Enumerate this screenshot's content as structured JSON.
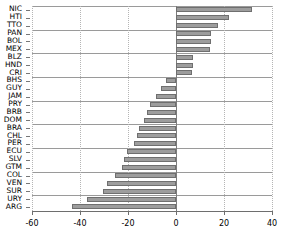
{
  "chart_data": {
    "type": "bar",
    "orientation": "horizontal",
    "title": "",
    "xlabel": "",
    "ylabel": "",
    "xlim": [
      -60,
      40
    ],
    "ylim": null,
    "grid": true,
    "legend": null,
    "xticks": [
      -60,
      -40,
      -20,
      0,
      20,
      40
    ],
    "xtick_labels": [
      "-60",
      "-40",
      "-20",
      "0",
      "20",
      "40"
    ],
    "categories": [
      "NIC",
      "HTI",
      "TTO",
      "PAN",
      "BOL",
      "MEX",
      "BLZ",
      "HND",
      "CRI",
      "BHS",
      "GUY",
      "JAM",
      "PRY",
      "BRB",
      "DOM",
      "BRA",
      "CHL",
      "PER",
      "ECU",
      "SLV",
      "GTM",
      "COL",
      "VEN",
      "SUR",
      "URY",
      "ARG"
    ],
    "values": [
      31.7,
      22.1,
      17.5,
      14.6,
      14.6,
      14.2,
      7.1,
      7.1,
      6.7,
      -4.2,
      -6.3,
      -8.3,
      -10.8,
      -12.1,
      -13.3,
      -15.4,
      -16.3,
      -17.5,
      -20.4,
      -21.7,
      -22.5,
      -25.4,
      -28.8,
      -30.4,
      -37.1,
      -43.3
    ],
    "series_name": "",
    "bar_color": "#9d9d9d",
    "bar_edge_color": "#6f6f6f"
  },
  "axis": {
    "zero_value": 0
  }
}
